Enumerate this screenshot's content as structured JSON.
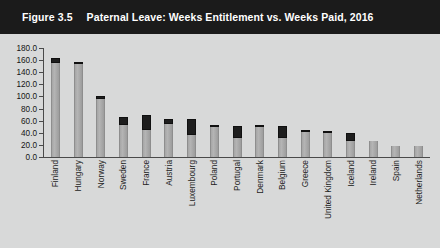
{
  "figure": {
    "number": "Figure 3.5",
    "title": "Paternal Leave: Weeks Entitlement vs. Weeks Paid, 2016"
  },
  "colors": {
    "banner_background": "#1b1b1b",
    "banner_text": "#ffffff",
    "panel_background": "#d8d9d9",
    "paid_bar": "#a9a9a9",
    "unpaid_bar": "#1e1e1e",
    "axis": "#4a4a4a"
  },
  "chart_data": {
    "type": "bar",
    "title": "Paternal Leave: Weeks Entitlement vs. Weeks Paid, 2016",
    "xlabel": "",
    "ylabel": "",
    "ylim": [
      0,
      180
    ],
    "yticks": [
      "0.0",
      "20.0",
      "40.0",
      "60.0",
      "80.0",
      "100.0",
      "120.0",
      "140.0",
      "160.0",
      "180.0"
    ],
    "ytick_values": [
      0,
      20,
      40,
      60,
      80,
      100,
      120,
      140,
      160,
      180
    ],
    "grid": false,
    "legend": "none",
    "stacked": true,
    "categories": [
      "Finland",
      "Hungary",
      "Norway",
      "Sweden",
      "France",
      "Austria",
      "Luxembourg",
      "Poland",
      "Portugal",
      "Denmark",
      "Belgium",
      "Greece",
      "United Kingdom",
      "Iceland",
      "Ireland",
      "Spain",
      "Netherlands"
    ],
    "series": [
      {
        "name": "Weeks Paid",
        "values": [
          155,
          154,
          95,
          53,
          44,
          54,
          36,
          50,
          32,
          50,
          32,
          42,
          39,
          27,
          26,
          18,
          18
        ]
      },
      {
        "name": "Weeks Unpaid (Entitlement beyond Paid)",
        "values": [
          9,
          3,
          6,
          13,
          26,
          8,
          26,
          2,
          20,
          2,
          20,
          2,
          1,
          13,
          0,
          0,
          0
        ]
      }
    ],
    "totals": [
      164,
      157,
      101,
      66,
      70,
      62,
      62,
      52,
      52,
      52,
      52,
      44,
      40,
      40,
      26,
      18,
      18
    ]
  }
}
